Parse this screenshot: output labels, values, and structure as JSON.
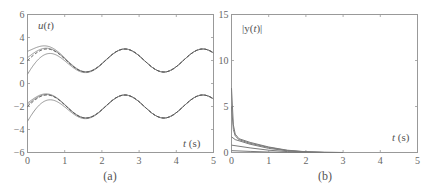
{
  "figure": {
    "panel_a": {
      "caption": "(a)",
      "ylabel": "u(t)",
      "xlabel": "t (s)"
    },
    "panel_b": {
      "caption": "(b)",
      "ylabel": "|y(t)|",
      "xlabel": "t (s)"
    }
  },
  "chart_data": [
    {
      "type": "line",
      "title": "(a)",
      "xlabel": "t (s)",
      "ylabel": "u(t)",
      "xlim": [
        0,
        5
      ],
      "ylim": [
        -6,
        6
      ],
      "xticks": [
        0,
        1,
        2,
        3,
        4,
        5
      ],
      "yticks": [
        -6,
        -4,
        -2,
        0,
        2,
        4,
        6
      ],
      "grid": false,
      "series": [
        {
          "name": "upper reference (dashed)",
          "style": "dashed",
          "formula": "2 + sin(3t)",
          "x": [
            0,
            0.5,
            1.0,
            1.57,
            2.1,
            2.6,
            3.1,
            3.67,
            4.2,
            4.7,
            5.0
          ],
          "values": [
            2.2,
            3.0,
            2.14,
            1.0,
            2.03,
            3.0,
            1.93,
            1.0,
            1.96,
            2.99,
            2.65
          ]
        },
        {
          "name": "upper trajectories (solid)",
          "style": "solid",
          "x": [
            0,
            0.1,
            0.5,
            1.0,
            1.57,
            5.0
          ],
          "values": [
            [
              3.0,
              2.8,
              3.2,
              2.2,
              1.0,
              2.65
            ],
            [
              1.0,
              1.8,
              2.7,
              2.1,
              1.0,
              2.65
            ]
          ]
        },
        {
          "name": "lower reference (dashed)",
          "style": "dashed",
          "formula": "-2 + sin(3t)",
          "x": [
            0,
            0.5,
            1.0,
            1.57,
            2.1,
            2.6,
            3.1,
            3.67,
            4.2,
            4.7,
            5.0
          ],
          "values": [
            -1.8,
            -1.0,
            -1.86,
            -3.0,
            -1.97,
            -1.0,
            -2.07,
            -3.0,
            -2.04,
            -1.01,
            -1.35
          ]
        },
        {
          "name": "lower trajectories (solid)",
          "style": "solid",
          "x": [
            0,
            0.1,
            0.5,
            1.0,
            1.57,
            5.0
          ],
          "values": [
            [
              -1.7,
              -1.4,
              -0.9,
              -1.8,
              -3.0,
              -1.35
            ],
            [
              -3.3,
              -2.0,
              -1.3,
              -1.9,
              -3.0,
              -1.35
            ]
          ]
        }
      ]
    },
    {
      "type": "line",
      "title": "(b)",
      "xlabel": "t (s)",
      "ylabel": "|y(t)|",
      "xlim": [
        0,
        5
      ],
      "ylim": [
        0,
        15
      ],
      "xticks": [
        0,
        1,
        2,
        3,
        4,
        5
      ],
      "yticks": [
        0,
        5,
        10,
        15
      ],
      "grid": false,
      "series": [
        {
          "name": "trajectory 1",
          "x": [
            0,
            0.05,
            0.1,
            0.2,
            0.5,
            1.0,
            1.5,
            2.0,
            2.5,
            3.0
          ],
          "values": [
            7.0,
            3.0,
            2.0,
            1.5,
            1.1,
            0.6,
            0.25,
            0.08,
            0.02,
            0.0
          ]
        },
        {
          "name": "trajectory 2",
          "x": [
            0,
            0.05,
            0.1,
            0.2,
            0.5,
            1.0,
            1.5,
            2.0,
            2.5,
            3.0
          ],
          "values": [
            5.0,
            2.5,
            1.8,
            1.4,
            1.0,
            0.55,
            0.22,
            0.07,
            0.02,
            0.0
          ]
        },
        {
          "name": "trajectory 3",
          "x": [
            0,
            0.1,
            0.5,
            1.0,
            1.5,
            2.0,
            2.5
          ],
          "values": [
            1.7,
            1.4,
            0.9,
            0.45,
            0.18,
            0.05,
            0.0
          ]
        },
        {
          "name": "trajectory 4",
          "x": [
            0,
            0.5,
            1.0,
            1.5,
            2.0,
            2.5
          ],
          "values": [
            0.8,
            0.5,
            0.25,
            0.1,
            0.03,
            0.0
          ]
        },
        {
          "name": "trajectory 5",
          "x": [
            0,
            0.5,
            1.0,
            1.5,
            2.0
          ],
          "values": [
            0.2,
            0.12,
            0.05,
            0.02,
            0.0
          ]
        }
      ]
    }
  ]
}
